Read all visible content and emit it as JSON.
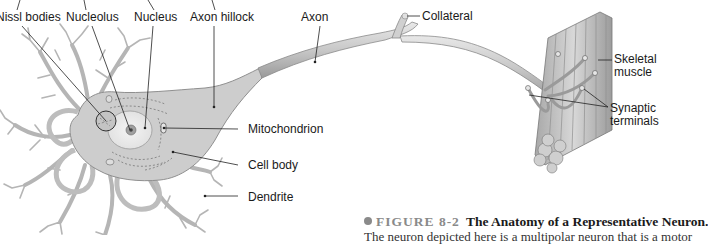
{
  "figure": {
    "title": "The Anatomy of a Representative Neuron.",
    "number_label": "FIGURE 8-2",
    "caption_continuation": "The neuron depicted here is a multipolar neuron that is a motor"
  },
  "labels": {
    "nissl_bodies": "Nissl bodies",
    "nucleolus": "Nucleolus",
    "nucleus": "Nucleus",
    "axon_hillock": "Axon hillock",
    "axon": "Axon",
    "collateral": "Collateral",
    "skeletal_muscle_line1": "Skeletal",
    "skeletal_muscle_line2": "muscle",
    "synaptic_terminals_line1": "Synaptic",
    "synaptic_terminals_line2": "terminals",
    "mitochondrion": "Mitochondrion",
    "cell_body": "Cell body",
    "dendrite": "Dendrite"
  },
  "colors": {
    "cell_fill": "#cfcfcf",
    "cell_stroke": "#8c8c8c",
    "dendrite": "#b9b9b9",
    "leader_line": "#222222",
    "caption_accent": "#8a8a8a"
  }
}
